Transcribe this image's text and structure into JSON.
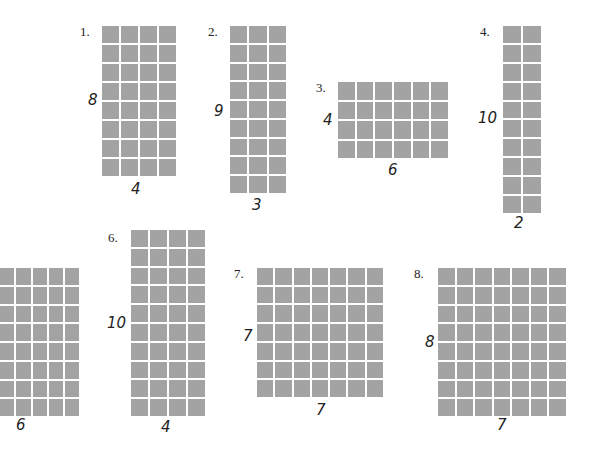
{
  "problems": [
    {
      "label": "1.",
      "rows": 8,
      "cols": 4,
      "height_label": "8",
      "width_label": "4",
      "grid": {
        "x": 102,
        "y": 26,
        "w": 74,
        "h": 150
      },
      "label_pos": {
        "x": 80,
        "y": 24
      },
      "h_pos": {
        "x": 88,
        "y": 91
      },
      "w_pos": {
        "x": 131,
        "y": 180
      }
    },
    {
      "label": "2.",
      "rows": 9,
      "cols": 3,
      "height_label": "9",
      "width_label": "3",
      "grid": {
        "x": 230,
        "y": 26,
        "w": 56,
        "h": 167
      },
      "label_pos": {
        "x": 208,
        "y": 24
      },
      "h_pos": {
        "x": 214,
        "y": 102
      },
      "w_pos": {
        "x": 252,
        "y": 196
      }
    },
    {
      "label": "3.",
      "rows": 4,
      "cols": 6,
      "height_label": "4",
      "width_label": "6",
      "grid": {
        "x": 338,
        "y": 82,
        "w": 110,
        "h": 76
      },
      "label_pos": {
        "x": 316,
        "y": 80
      },
      "h_pos": {
        "x": 323,
        "y": 111
      },
      "w_pos": {
        "x": 388,
        "y": 161
      }
    },
    {
      "label": "4.",
      "rows": 10,
      "cols": 2,
      "height_label": "10",
      "width_label": "2",
      "grid": {
        "x": 503,
        "y": 26,
        "w": 38,
        "h": 187
      },
      "label_pos": {
        "x": 480,
        "y": 24
      },
      "h_pos": {
        "x": 478,
        "y": 109
      },
      "w_pos": {
        "x": 514,
        "y": 214
      }
    },
    {
      "label": "",
      "rows": 8,
      "cols": 6,
      "height_label": "",
      "width_label": "6",
      "grid": {
        "x": -16,
        "y": 268,
        "w": 95,
        "h": 148
      },
      "label_pos": {
        "x": 0,
        "y": 0
      },
      "h_pos": {
        "x": 0,
        "y": 0
      },
      "w_pos": {
        "x": 16,
        "y": 416
      }
    },
    {
      "label": "6.",
      "rows": 10,
      "cols": 4,
      "height_label": "10",
      "width_label": "4",
      "grid": {
        "x": 131,
        "y": 230,
        "w": 74,
        "h": 186
      },
      "label_pos": {
        "x": 108,
        "y": 230
      },
      "h_pos": {
        "x": 107,
        "y": 314
      },
      "w_pos": {
        "x": 161,
        "y": 418
      }
    },
    {
      "label": "7.",
      "rows": 7,
      "cols": 7,
      "height_label": "7",
      "width_label": "7",
      "grid": {
        "x": 257,
        "y": 268,
        "w": 126,
        "h": 129
      },
      "label_pos": {
        "x": 234,
        "y": 266
      },
      "h_pos": {
        "x": 243,
        "y": 327
      },
      "w_pos": {
        "x": 316,
        "y": 401
      }
    },
    {
      "label": "8.",
      "rows": 8,
      "cols": 7,
      "height_label": "8",
      "width_label": "7",
      "grid": {
        "x": 438,
        "y": 268,
        "w": 128,
        "h": 148
      },
      "label_pos": {
        "x": 414,
        "y": 266
      },
      "h_pos": {
        "x": 425,
        "y": 333
      },
      "w_pos": {
        "x": 497,
        "y": 416
      }
    }
  ],
  "colors": {
    "cell": "#a3a3a3",
    "grid_line": "#ffffff",
    "text": "#222222"
  }
}
